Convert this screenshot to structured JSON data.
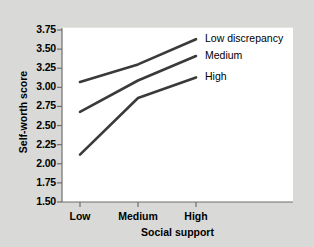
{
  "chart_data": {
    "type": "line",
    "title": "",
    "xlabel": "Social support",
    "ylabel": "Self-worth score",
    "categories": [
      "Low",
      "Medium",
      "High"
    ],
    "ylim": [
      1.5,
      3.75
    ],
    "yticks": [
      "1.50",
      "1.75",
      "2.00",
      "2.25",
      "2.50",
      "2.75",
      "3.00",
      "3.25",
      "3.50",
      "3.75"
    ],
    "ytick_values": [
      1.5,
      1.75,
      2.0,
      2.25,
      2.5,
      2.75,
      3.0,
      3.25,
      3.5,
      3.75
    ],
    "grid": false,
    "legend_position": "inline-right-end-of-line",
    "line_color": "#3a3a3a",
    "background_color": "#d9d9d7",
    "plot_background_color": "#ffffff",
    "series": [
      {
        "name": "Low discrepancy",
        "values": [
          3.07,
          3.3,
          3.63
        ]
      },
      {
        "name": "Medium",
        "values": [
          2.68,
          3.09,
          3.41
        ]
      },
      {
        "name": "High",
        "values": [
          2.12,
          2.86,
          3.13
        ]
      }
    ]
  }
}
